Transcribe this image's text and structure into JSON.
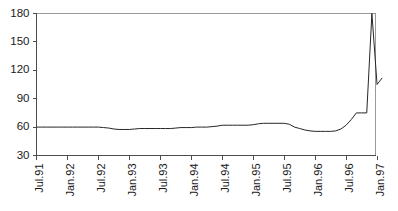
{
  "chart_data": {
    "type": "line",
    "title": "",
    "subtitle": "",
    "xlabel": "",
    "ylabel": "",
    "ylim": [
      30,
      180
    ],
    "yticks": [
      30,
      60,
      90,
      120,
      150,
      180
    ],
    "ytick_labels": [
      "30",
      "60",
      "90",
      "120",
      "150",
      "180"
    ],
    "xtick_labels": [
      "Jul.91",
      "Jan.92",
      "Jul.92",
      "Jan.93",
      "Jul.93",
      "Jan.94",
      "Jul.94",
      "Jan.95",
      "Jul.95",
      "Jan.96",
      "Jul.96",
      "Jan.97"
    ],
    "grid": false,
    "legend": null,
    "legend_position": "none",
    "line_color": "#262626",
    "axis_color": "#4d4d4d",
    "frame_color": "#9a9a9a",
    "background_color": "#ffffff",
    "x_start_label": "Jul.91",
    "x_end_label": "Feb.97",
    "x_interval_months": 1,
    "series": [
      {
        "name": "series-1",
        "x": [
          "Jul.91",
          "Aug.91",
          "Sep.91",
          "Oct.91",
          "Nov.91",
          "Dec.91",
          "Jan.92",
          "Feb.92",
          "Mar.92",
          "Apr.92",
          "May.92",
          "Jun.92",
          "Jul.92",
          "Aug.92",
          "Sep.92",
          "Oct.92",
          "Nov.92",
          "Dec.92",
          "Jan.93",
          "Feb.93",
          "Mar.93",
          "Apr.93",
          "May.93",
          "Jun.93",
          "Jul.93",
          "Aug.93",
          "Sep.93",
          "Oct.93",
          "Nov.93",
          "Dec.93",
          "Jan.94",
          "Feb.94",
          "Mar.94",
          "Apr.94",
          "May.94",
          "Jun.94",
          "Jul.94",
          "Aug.94",
          "Sep.94",
          "Oct.94",
          "Nov.94",
          "Dec.94",
          "Jan.95",
          "Feb.95",
          "Mar.95",
          "Apr.95",
          "May.95",
          "Jun.95",
          "Jul.95",
          "Aug.95",
          "Sep.95",
          "Oct.95",
          "Nov.95",
          "Dec.95",
          "Jan.96",
          "Feb.96",
          "Mar.96",
          "Apr.96",
          "May.96",
          "Jun.96",
          "Jul.96",
          "Aug.96",
          "Sep.96",
          "Oct.96",
          "Nov.96",
          "Dec.96",
          "Jan.97",
          "Feb.97"
        ],
        "values": [
          60,
          60,
          60,
          60,
          60,
          60,
          60,
          60,
          60,
          60,
          60,
          60,
          60,
          59.5,
          59,
          58,
          57.5,
          57.5,
          57.5,
          58,
          58.5,
          58.5,
          58.5,
          58.5,
          58.5,
          58.5,
          58.5,
          59,
          59.5,
          59.5,
          59.5,
          60,
          60,
          60,
          60.5,
          61,
          62,
          62,
          62,
          62,
          62,
          62,
          62.5,
          63.5,
          64,
          64,
          64,
          64,
          64,
          63,
          60,
          58.5,
          57,
          56,
          55.5,
          55.5,
          55.5,
          55.5,
          56,
          58,
          62,
          68,
          75,
          75,
          75,
          180,
          105,
          112
        ]
      }
    ]
  }
}
